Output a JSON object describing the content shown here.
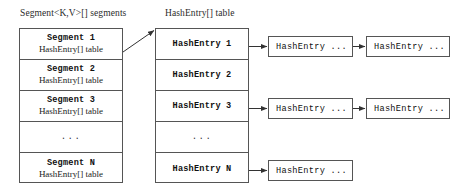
{
  "diagram": {
    "headers": {
      "segments": "Segment<K,V>[] segments",
      "hashentry": "HashEntry[] table"
    },
    "segments_table": {
      "rows": [
        {
          "title": "Segment 1",
          "subtitle": "HashEntry[] table",
          "kind": "entry"
        },
        {
          "title": "Segment 2",
          "subtitle": "HashEntry[] table",
          "kind": "entry"
        },
        {
          "title": "Segment 3",
          "subtitle": "HashEntry[] table",
          "kind": "entry"
        },
        {
          "title": "...",
          "subtitle": "",
          "kind": "ellipsis"
        },
        {
          "title": "Segment N",
          "subtitle": "HashEntry[] table",
          "kind": "entry"
        }
      ]
    },
    "hashentry_table": {
      "rows": [
        {
          "title": "HashEntry 1",
          "kind": "entry"
        },
        {
          "title": "HashEntry 2",
          "kind": "entry"
        },
        {
          "title": "HashEntry 3",
          "kind": "entry"
        },
        {
          "title": "...",
          "kind": "ellipsis"
        },
        {
          "title": "HashEntry N",
          "kind": "entry"
        }
      ]
    },
    "chains": [
      {
        "row": "HashEntry 1",
        "nodes": [
          "HashEntry ...",
          "HashEntry ..."
        ]
      },
      {
        "row": "HashEntry 3",
        "nodes": [
          "HashEntry ...",
          "HashEntry ..."
        ]
      },
      {
        "row": "HashEntry N",
        "nodes": [
          "HashEntry ..."
        ]
      }
    ],
    "colors": {
      "border": "#555555",
      "text": "#111111",
      "background": "#ffffff",
      "arrow": "#333333"
    }
  }
}
